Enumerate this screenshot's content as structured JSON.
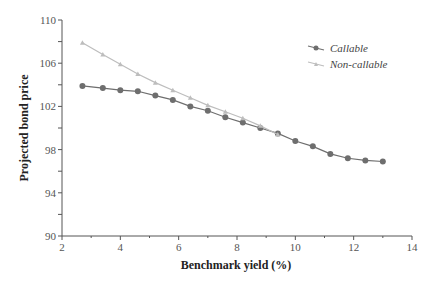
{
  "chart_data": {
    "type": "line",
    "title": "",
    "xlabel": "Benchmark yield (%)",
    "ylabel": "Projected bond price",
    "xlim": [
      2,
      14
    ],
    "ylim": [
      90,
      110
    ],
    "xticks": [
      2,
      4,
      6,
      8,
      10,
      12,
      14
    ],
    "yticks": [
      90,
      94,
      98,
      102,
      106,
      110
    ],
    "legend": "top-right",
    "series": [
      {
        "name": "Callable",
        "color": "#6e6e6e",
        "marker": "circle",
        "x": [
          2.7,
          3.4,
          4.0,
          4.6,
          5.2,
          5.8,
          6.4,
          7.0,
          7.6,
          8.2,
          8.8,
          9.4,
          10.0,
          10.6,
          11.2,
          11.8,
          12.4,
          13.0
        ],
        "y": [
          103.9,
          103.7,
          103.5,
          103.4,
          103.0,
          102.6,
          102.0,
          101.6,
          101.0,
          100.5,
          100.0,
          99.5,
          98.8,
          98.3,
          97.6,
          97.2,
          97.0,
          96.9
        ]
      },
      {
        "name": "Non-callable",
        "color": "#bdbdbd",
        "marker": "triangle",
        "x": [
          2.7,
          3.4,
          4.0,
          4.6,
          5.2,
          5.8,
          6.4,
          7.0,
          7.6,
          8.2,
          8.8,
          9.4
        ],
        "y": [
          107.9,
          106.8,
          105.9,
          105.0,
          104.2,
          103.5,
          102.8,
          102.1,
          101.5,
          100.9,
          100.2,
          99.4
        ]
      }
    ]
  }
}
